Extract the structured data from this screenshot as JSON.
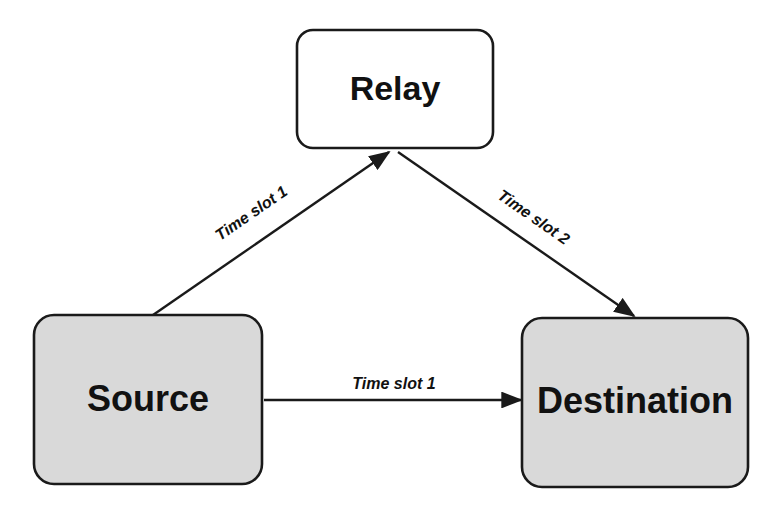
{
  "diagram": {
    "background_color": "#ffffff",
    "stroke_color": "#1a1a1a",
    "nodes": [
      {
        "id": "relay",
        "label": "Relay",
        "fill": "#ffffff",
        "x": 297,
        "y": 30,
        "width": 196,
        "height": 118,
        "radius": 16
      },
      {
        "id": "source",
        "label": "Source",
        "fill": "#d9d9d9",
        "x": 34,
        "y": 315,
        "width": 228,
        "height": 169,
        "radius": 20
      },
      {
        "id": "destination",
        "label": "Destination",
        "fill": "#d9d9d9",
        "x": 522,
        "y": 318,
        "width": 226,
        "height": 169,
        "radius": 20
      }
    ],
    "edges": [
      {
        "id": "source-to-relay",
        "label": "Time slot 1",
        "from": "source",
        "to": "relay",
        "x1": 153,
        "y1": 315,
        "x2": 389,
        "y2": 152,
        "label_x": 252,
        "label_y": 214,
        "label_rotation": -34.6
      },
      {
        "id": "relay-to-destination",
        "label": "Time slot 2",
        "from": "relay",
        "to": "destination",
        "x1": 398,
        "y1": 152,
        "x2": 634,
        "y2": 316,
        "label_x": 533,
        "label_y": 218,
        "label_rotation": 34.8
      },
      {
        "id": "source-to-destination",
        "label": "Time slot 1",
        "from": "source",
        "to": "destination",
        "x1": 264,
        "y1": 400,
        "x2": 521,
        "y2": 400,
        "label_x": 394,
        "label_y": 385,
        "label_rotation": 0
      }
    ]
  }
}
